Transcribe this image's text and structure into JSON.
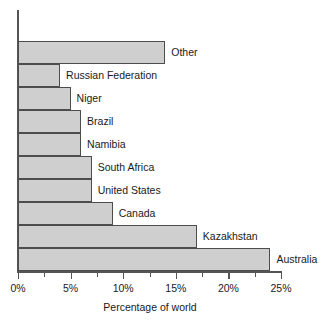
{
  "chart_data": {
    "type": "bar",
    "orientation": "horizontal",
    "title": "",
    "xlabel": "Percentage of world",
    "ylabel": "",
    "xlim": [
      0,
      25
    ],
    "xtick_labels": [
      "0%",
      "5%",
      "10%",
      "15%",
      "20%",
      "25%"
    ],
    "xtick_values": [
      0,
      5,
      10,
      15,
      20,
      25
    ],
    "minor_ticks": [
      2.5,
      7.5,
      12.5,
      17.5,
      22.5
    ],
    "grid": false,
    "legend": false,
    "bar_fill_color": "#cfcfcf",
    "bar_edge_color": "#4d4d4d",
    "axis_color": "#555555",
    "categories": [
      "Other",
      "Russian Federation",
      "Niger",
      "Brazil",
      "Namibia",
      "South Africa",
      "United States",
      "Canada",
      "Kazakhstan",
      "Australia"
    ],
    "values": [
      14,
      4,
      5,
      6,
      6,
      7,
      7,
      9,
      17,
      24
    ],
    "value_unit": "%"
  }
}
